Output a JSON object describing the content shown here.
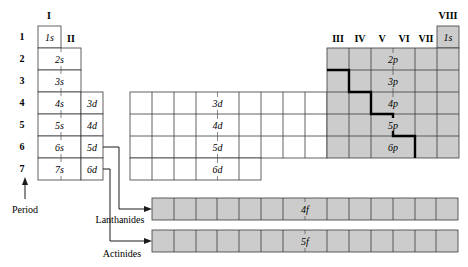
{
  "diagram": {
    "colors": {
      "line": "#3a3a3a",
      "shaded": "#cccccc",
      "white": "#ffffff",
      "staircase": "#000000"
    },
    "group_labels": {
      "I": "I",
      "II": "II",
      "III": "III",
      "IV": "IV",
      "V": "V",
      "VI": "VI",
      "VII": "VII",
      "VIII": "VIII"
    },
    "period_axis_label": "Period",
    "periods": [
      "1",
      "2",
      "3",
      "4",
      "5",
      "6",
      "7"
    ],
    "s_block": {
      "cells": [
        "1s",
        "2s",
        "3s",
        "4s",
        "5s",
        "6s",
        "7s"
      ]
    },
    "d_column": {
      "cells": [
        "3d",
        "4d",
        "5d",
        "6d"
      ]
    },
    "d_block": {
      "rows": [
        "3d",
        "4d",
        "5d",
        "6d"
      ]
    },
    "p_block": {
      "helium": "1s",
      "rows": [
        "2p",
        "3p",
        "4p",
        "5p",
        "6p"
      ]
    },
    "f_block": {
      "rows": [
        {
          "label": "4f",
          "series": "Lanthanides"
        },
        {
          "label": "5f",
          "series": "Actinides"
        }
      ],
      "cell_count": 14
    }
  }
}
